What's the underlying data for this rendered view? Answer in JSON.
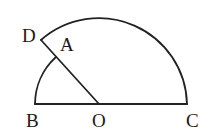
{
  "diagram": {
    "type": "geometry",
    "points": {
      "B": {
        "label": "B",
        "x": 35,
        "y": 104
      },
      "O": {
        "label": "O",
        "x": 99,
        "y": 104
      },
      "C": {
        "label": "C",
        "x": 187,
        "y": 104
      },
      "D": {
        "label": "D",
        "x": 41,
        "y": 40
      },
      "A": {
        "label": "A",
        "x": 56,
        "y": 57
      }
    },
    "segments": [
      {
        "from": "B",
        "to": "C"
      },
      {
        "from": "O",
        "to": "D"
      }
    ],
    "arcs": [
      {
        "name": "outer-arc",
        "center": "O",
        "from": "D",
        "to": "C",
        "radius": 88
      },
      {
        "name": "inner-arc",
        "center": "O",
        "from": "B",
        "to": "A",
        "radius": 64
      }
    ],
    "colors": {
      "stroke": "#222222",
      "background": "#ffffff"
    }
  }
}
